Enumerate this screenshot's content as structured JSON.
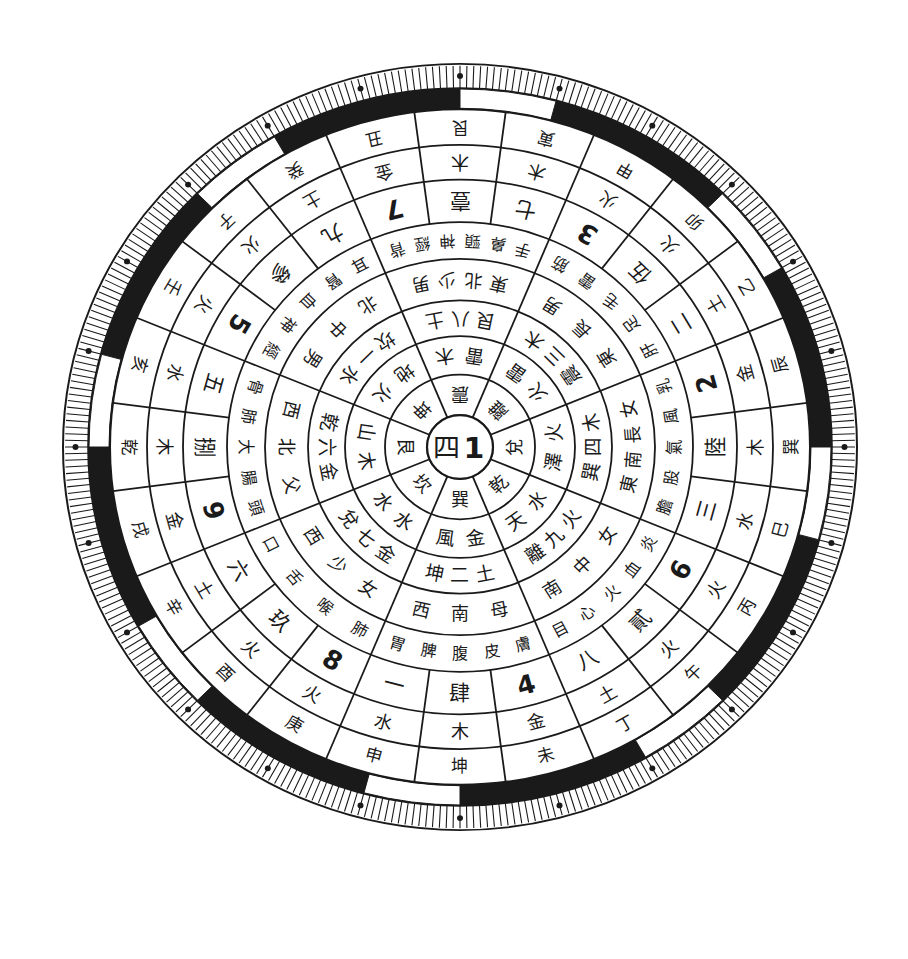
{
  "chart_data": {
    "type": "diagram",
    "title": "",
    "center": {
      "label_hanzi_number": "四",
      "label_digit": "1"
    },
    "inner_sectors": [
      {
        "position": "bottom",
        "trigram": "巽",
        "image": "風金",
        "number": "坤二土",
        "family": "西南母",
        "body": "胃脾腹皮膚"
      },
      {
        "position": "bottom-right",
        "trigram": "乾",
        "image": "天水",
        "number": "離九火",
        "family": "南中女",
        "body": "目心火血炎"
      },
      {
        "position": "right",
        "trigram": "兌",
        "image": "澤火",
        "number": "巽四木",
        "family": "東南長女",
        "body": "膽股氣風乳"
      },
      {
        "position": "top-right",
        "trigram": "離",
        "image": "火雷",
        "number": "震三木",
        "family": "東長男",
        "body": "肝足毛雷筋"
      },
      {
        "position": "top",
        "trigram": "震",
        "image": "雷木",
        "number": "艮八土",
        "family": "東北少男",
        "body": "手鼻頸神經背"
      },
      {
        "position": "top-left",
        "trigram": "坤",
        "image": "地火",
        "number": "坎一水",
        "family": "北中男",
        "body": "耳腎血神經"
      },
      {
        "position": "left",
        "trigram": "艮",
        "image": "山木",
        "number": "乾六金",
        "family": "西北父",
        "body": "骨肺大腸頭"
      },
      {
        "position": "bottom-left",
        "trigram": "坎",
        "image": "水水",
        "number": "兌七金",
        "family": "西少女",
        "body": "口舌喉肺"
      }
    ],
    "outer_groups": [
      {
        "position": "bottom",
        "ring_a": [
          "一",
          "肆",
          "4"
        ],
        "ring_b": [
          "水",
          "木",
          "金"
        ],
        "mountains": [
          "申",
          "坤",
          "未"
        ]
      },
      {
        "position": "bottom-right",
        "ring_a": [
          "八",
          "貳",
          "6"
        ],
        "ring_b": [
          "土",
          "火",
          "火"
        ],
        "mountains": [
          "丁",
          "午",
          "丙"
        ]
      },
      {
        "position": "right",
        "ring_a": [
          "三",
          "陸",
          "2"
        ],
        "ring_b": [
          "水",
          "木",
          "金"
        ],
        "mountains": [
          "巳",
          "巽",
          "辰"
        ]
      },
      {
        "position": "top-right",
        "ring_a": [
          "二",
          "伍",
          "3"
        ],
        "ring_b": [
          "土",
          "火",
          "火"
        ],
        "mountains": [
          "乙",
          "卯",
          "甲"
        ]
      },
      {
        "position": "top",
        "ring_a": [
          "七",
          "壹",
          "7"
        ],
        "ring_b": [
          "木",
          "木",
          "金"
        ],
        "mountains": [
          "寅",
          "艮",
          "丑"
        ]
      },
      {
        "position": "top-left",
        "ring_a": [
          "九",
          "參",
          "5"
        ],
        "ring_b": [
          "土",
          "火",
          "火"
        ],
        "mountains": [
          "癸",
          "子",
          "壬"
        ]
      },
      {
        "position": "left",
        "ring_a": [
          "五",
          "捌",
          "9"
        ],
        "ring_b": [
          "水",
          "木",
          "金"
        ],
        "mountains": [
          "亥",
          "乾",
          "戌"
        ]
      },
      {
        "position": "bottom-left",
        "ring_a": [
          "六",
          "玖",
          "8"
        ],
        "ring_b": [
          "土",
          "火",
          "火"
        ],
        "mountains": [
          "辛",
          "酉",
          "庚"
        ]
      }
    ],
    "outer_band": {
      "style": "alternating black/white arcs",
      "white_gap_centers_deg": [
        -82.5,
        -37.5,
        7.5,
        52.5,
        97.5,
        142.5,
        187.5,
        232.5
      ],
      "gap_span_deg": 15
    },
    "tick_ring": {
      "tick_count": 360,
      "dot_markers": 24
    }
  },
  "colors": {
    "ink": "#1a1a1a",
    "paper": "#ffffff"
  }
}
